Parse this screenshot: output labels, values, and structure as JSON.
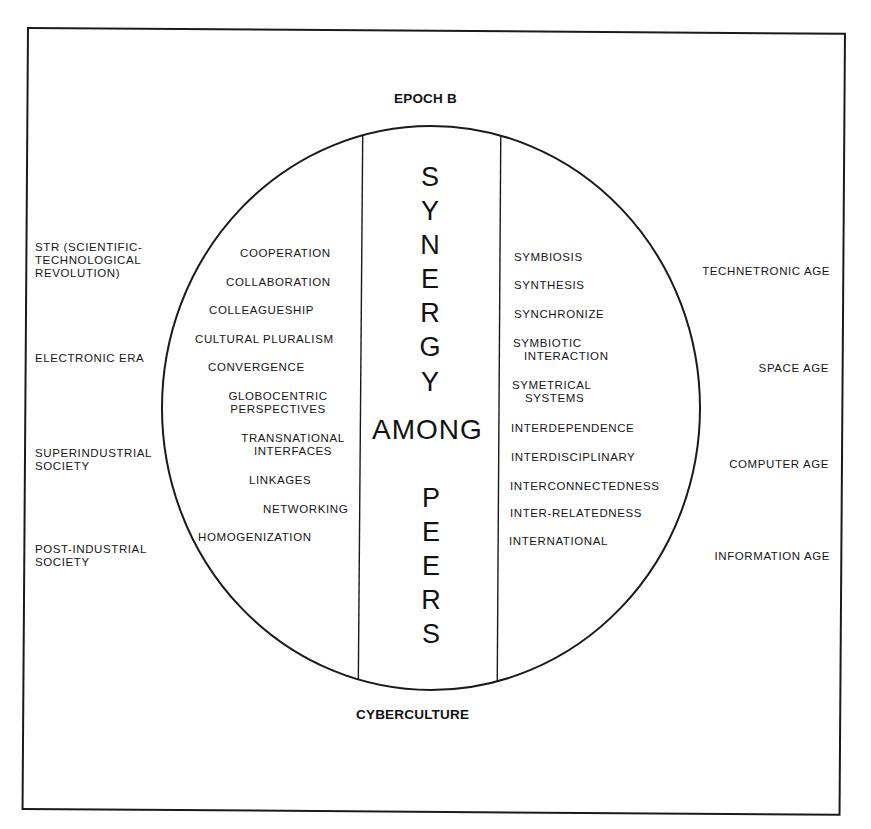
{
  "title_top": "EPOCH B",
  "title_bottom": "CYBERCULTURE",
  "center_column": {
    "word1": "SYNERGY",
    "word1_letters": [
      "S",
      "Y",
      "N",
      "E",
      "R",
      "G",
      "Y"
    ],
    "word2": "AMONG",
    "word3": "PEERS",
    "word3_letters": [
      "P",
      "E",
      "E",
      "R",
      "S"
    ]
  },
  "inner_left": [
    {
      "lines": [
        "COOPERATION"
      ]
    },
    {
      "lines": [
        "COLLABORATION"
      ]
    },
    {
      "lines": [
        "COLLEAGUESHIP"
      ]
    },
    {
      "lines": [
        "CULTURAL PLURALISM"
      ]
    },
    {
      "lines": [
        "CONVERGENCE"
      ]
    },
    {
      "lines": [
        "GLOBOCENTRIC",
        "PERSPECTIVES"
      ]
    },
    {
      "lines": [
        "TRANSNATIONAL",
        "INTERFACES"
      ]
    },
    {
      "lines": [
        "LINKAGES"
      ]
    },
    {
      "lines": [
        "NETWORKING"
      ]
    },
    {
      "lines": [
        "HOMOGENIZATION"
      ]
    }
  ],
  "inner_right": [
    {
      "lines": [
        "SYMBIOSIS"
      ]
    },
    {
      "lines": [
        "SYNTHESIS"
      ]
    },
    {
      "lines": [
        "SYNCHRONIZE"
      ]
    },
    {
      "lines": [
        "SYMBIOTIC",
        "INTERACTION"
      ]
    },
    {
      "lines": [
        "SYMETRICAL",
        "SYSTEMS"
      ]
    },
    {
      "lines": [
        "INTERDEPENDENCE"
      ]
    },
    {
      "lines": [
        "INTERDISCIPLINARY"
      ]
    },
    {
      "lines": [
        "INTERCONNECTEDNESS"
      ]
    },
    {
      "lines": [
        "INTER-RELATEDNESS"
      ]
    },
    {
      "lines": [
        "INTERNATIONAL"
      ]
    }
  ],
  "outer_left": [
    {
      "lines": [
        "STR (SCIENTIFIC-",
        "TECHNOLOGICAL",
        "REVOLUTION)"
      ]
    },
    {
      "lines": [
        "ELECTRONIC ERA"
      ]
    },
    {
      "lines": [
        "SUPERINDUSTRIAL",
        "SOCIETY"
      ]
    },
    {
      "lines": [
        "POST-INDUSTRIAL",
        "SOCIETY"
      ]
    }
  ],
  "outer_right": [
    {
      "lines": [
        "TECHNETRONIC AGE"
      ]
    },
    {
      "lines": [
        "SPACE AGE"
      ]
    },
    {
      "lines": [
        "COMPUTER AGE"
      ]
    },
    {
      "lines": [
        "INFORMATION AGE"
      ]
    }
  ],
  "colors": {
    "ink": "#141414",
    "paper": "#ffffff"
  }
}
